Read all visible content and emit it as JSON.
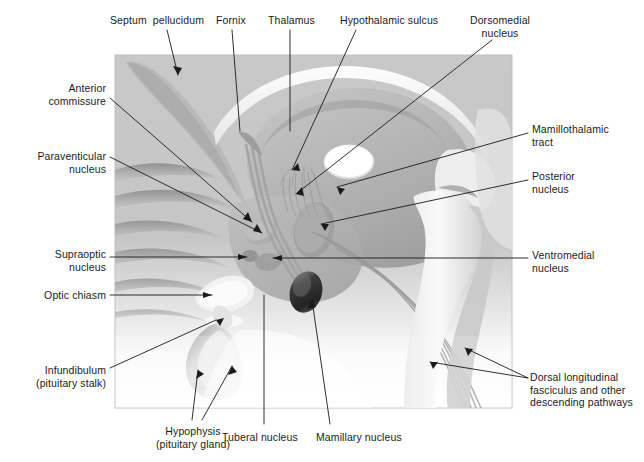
{
  "figure": {
    "panel": {
      "x": 115,
      "y": 55,
      "width": 397,
      "height": 353,
      "bg_top": "#c9c9c9",
      "bg_bottom": "#ffffff",
      "border": "#bdbdbd"
    },
    "palette": {
      "tissue_mid": "#b5b5b5",
      "tissue_light": "#d5d5d5",
      "tissue_pale": "#e9e9e9",
      "tissue_white": "#f7f7f7",
      "tissue_dark": "#8e8e8e",
      "shadow": "#7d7d7d",
      "mamillary_dark": "#2e2e2e",
      "tract_line": "#9a9a9a",
      "leader": "#1a1a1a",
      "text": "#1a1a1a"
    }
  },
  "labels": [
    {
      "id": "septum-pellucidum",
      "text": "Septum  pellucidum",
      "x": 110,
      "y": 14,
      "align": "left",
      "width": 110
    },
    {
      "id": "fornix",
      "text": "Fornix",
      "x": 216,
      "y": 14,
      "align": "left",
      "width": 44
    },
    {
      "id": "thalamus",
      "text": "Thalamus",
      "x": 268,
      "y": 14,
      "align": "left",
      "width": 56
    },
    {
      "id": "hypothalamic-sulcus",
      "text": "Hypothalamic sulcus",
      "x": 340,
      "y": 14,
      "align": "left",
      "width": 116
    },
    {
      "id": "dorsomedial-nucleus",
      "text": "Dorsomedial\nnucleus",
      "x": 468,
      "y": 14,
      "align": "center",
      "width": 86
    },
    {
      "id": "anterior-commissure",
      "text": "Anterior\ncommissure",
      "x": 8,
      "y": 82,
      "align": "right",
      "width": 98
    },
    {
      "id": "paraventricular-nucleus",
      "text": "Paraventicular\nnucleus",
      "x": 2,
      "y": 150,
      "align": "right",
      "width": 104
    },
    {
      "id": "supraoptic-nucleus",
      "text": "Supraoptic\nnucleus",
      "x": 14,
      "y": 248,
      "align": "right",
      "width": 92
    },
    {
      "id": "optic-chiasm",
      "text": "Optic chiasm",
      "x": 14,
      "y": 289,
      "align": "right",
      "width": 92
    },
    {
      "id": "infundibulum",
      "text": "Infundibulum\n(pituitary stalk)",
      "x": 6,
      "y": 364,
      "align": "right",
      "width": 100
    },
    {
      "id": "hypophysis",
      "text": "Hypophysis\n(pituitary gland)",
      "x": 136,
      "y": 425,
      "align": "center",
      "width": 108
    },
    {
      "id": "tuberal-nucleus",
      "text": "Tuberal nucleus",
      "x": 222,
      "y": 431,
      "align": "left",
      "width": 88
    },
    {
      "id": "mamillary-nucleus",
      "text": "Mamillary nucleus",
      "x": 316,
      "y": 431,
      "align": "left",
      "width": 100
    },
    {
      "id": "mamillothalamic-tract",
      "text": "Mamillothalamic\ntract",
      "x": 532,
      "y": 123,
      "align": "left",
      "width": 108
    },
    {
      "id": "posterior-nucleus",
      "text": "Posterior\nnucleus",
      "x": 532,
      "y": 170,
      "align": "left",
      "width": 70
    },
    {
      "id": "ventromedial-nucleus",
      "text": "Ventromedial\nnucleus",
      "x": 532,
      "y": 249,
      "align": "left",
      "width": 84
    },
    {
      "id": "dorsal-longitudinal-fasciculus",
      "text": "Dorsal longitudinal\nfasciculus and other\ndescending pathways",
      "x": 532,
      "y": 371,
      "align": "left",
      "width": 112
    }
  ],
  "leaders": [
    {
      "id": "leader-septum-pellucidum",
      "points": "167,30 178,75"
    },
    {
      "id": "leader-fornix",
      "points": "232,30 240,131"
    },
    {
      "id": "leader-thalamus",
      "points": "290,30 290,131"
    },
    {
      "id": "leader-hypothalamic-sulcus",
      "points": "356,30 292,170"
    },
    {
      "id": "leader-dorsomedial-nucleus",
      "points": "492,38 296,194"
    },
    {
      "id": "leader-anterior-commissure",
      "points": "110,98 252,222"
    },
    {
      "id": "leader-paraventricular-nucleus",
      "points": "110,157 262,233"
    },
    {
      "id": "leader-supraoptic-nucleus",
      "points": "110,257 247,257"
    },
    {
      "id": "leader-optic-chiasm",
      "points": "110,295 212,295"
    },
    {
      "id": "leader-infundibulum",
      "points": "110,368 216,320"
    },
    {
      "id": "leader-hypophysis-a",
      "points": "192,420 196,372"
    },
    {
      "id": "leader-hypophysis-b",
      "points": "200,420 230,368"
    },
    {
      "id": "leader-tuberal-nucleus",
      "points": "264,424 264,295"
    },
    {
      "id": "leader-mamillary-nucleus",
      "points": "330,424 312,300"
    },
    {
      "id": "leader-mamillothalamic-tract",
      "points": "528,133 337,187"
    },
    {
      "id": "leader-posterior-nucleus",
      "points": "528,180 321,224"
    },
    {
      "id": "leader-ventromedial-nucleus",
      "points": "528,258 273,258"
    },
    {
      "id": "leader-dfl-a",
      "points": "528,378 465,350"
    },
    {
      "id": "leader-dfl-b",
      "points": "528,378 430,364"
    }
  ],
  "structures": [
    {
      "id": "corpus-callosum",
      "name": "corpus callosum band"
    },
    {
      "id": "septum-body",
      "name": "septum pellucidum wedge"
    },
    {
      "id": "thalamus-body",
      "name": "thalamus oval"
    },
    {
      "id": "third-ventricle",
      "name": "third ventricle / massa intermedia"
    },
    {
      "id": "hypothalamus-region",
      "name": "hypothalamic grey region"
    },
    {
      "id": "optic-chiasm-body",
      "name": "optic chiasm"
    },
    {
      "id": "pituitary-gland",
      "name": "hypophysis"
    },
    {
      "id": "mamillary-body",
      "name": "mamillary body (dark)"
    },
    {
      "id": "brainstem",
      "name": "midbrain / pons / medulla"
    },
    {
      "id": "fornix-tract",
      "name": "fornix fibre bundle"
    },
    {
      "id": "descending-tracts",
      "name": "dorsal longitudinal fasciculus fibres"
    },
    {
      "id": "cortex-gyri",
      "name": "medial cortical gyri"
    }
  ]
}
